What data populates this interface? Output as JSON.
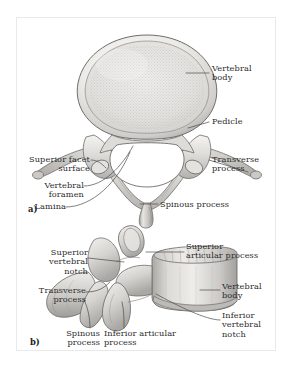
{
  "figure": {
    "frame_color": "#b9b9b9",
    "background": "#ffffff",
    "ink_color": "#2b2b2b",
    "leader_color": "#4a4a4a"
  },
  "panels": [
    {
      "id": "a",
      "marker": "a)",
      "view": "superior view",
      "labels": [
        {
          "name": "vertebral-body",
          "text": "Vertebral\nbody",
          "align": "left",
          "x": 212,
          "y": 64
        },
        {
          "name": "pedicle",
          "text": "Pedicle",
          "align": "left",
          "x": 212,
          "y": 119
        },
        {
          "name": "transverse-process",
          "text": "Transverse\nprocess",
          "align": "left",
          "x": 212,
          "y": 156
        },
        {
          "name": "superior-facet-surface",
          "text": "Superior facet\nsurface",
          "align": "right",
          "x": 32,
          "y": 156
        },
        {
          "name": "vertebral-foramen",
          "text": "Vertebral\nforamen",
          "align": "right",
          "x": 32,
          "y": 182
        },
        {
          "name": "lamina",
          "text": "Lamina",
          "align": "right",
          "x": 32,
          "y": 203
        },
        {
          "name": "spinous-process",
          "text": "Spinous process",
          "align": "left",
          "x": 160,
          "y": 201
        }
      ]
    },
    {
      "id": "b",
      "marker": "b)",
      "view": "lateral view",
      "labels": [
        {
          "name": "superior-articular-process",
          "text": "Superior\narticular process",
          "align": "left",
          "x": 186,
          "y": 244
        },
        {
          "name": "superior-vertebral-notch",
          "text": "Superior\nvertebral\nnotch",
          "align": "right",
          "x": 36,
          "y": 250
        },
        {
          "name": "transverse-process-b",
          "text": "Transverse\nprocess",
          "align": "right",
          "x": 36,
          "y": 288
        },
        {
          "name": "vertebral-body-b",
          "text": "Vertebral\nbody",
          "align": "left",
          "x": 222,
          "y": 283
        },
        {
          "name": "inferior-vertebral-notch",
          "text": "Inferior\nvertebral\nnotch",
          "align": "left",
          "x": 222,
          "y": 313
        },
        {
          "name": "spinous-process-b",
          "text": "Spinous\nprocess",
          "align": "right",
          "x": 100,
          "y": 330
        },
        {
          "name": "inferior-articular-process",
          "text": "Inferior articular\nprocess",
          "align": "left",
          "x": 104,
          "y": 330
        }
      ]
    }
  ],
  "art": {
    "bone_fill_light": "#f2f1ef",
    "bone_fill_mid": "#d8d6d3",
    "bone_fill_dark": "#a9a7a4",
    "outline": "#6f6d6b",
    "foramen_fill": "#ffffff",
    "trabecular_speckle": "#9b9996"
  }
}
